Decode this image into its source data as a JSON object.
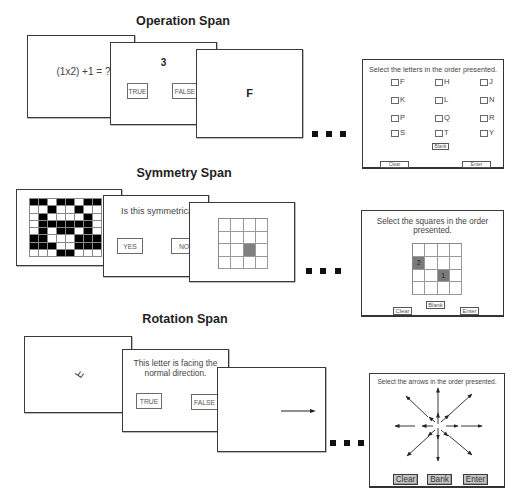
{
  "sections": {
    "operation": {
      "title": "Operation Span",
      "frame1": {
        "equation": "(1x2) +1 = ?"
      },
      "frame2": {
        "answer": "3",
        "true_label": "TRUE",
        "false_label": "FALSE"
      },
      "frame3": {
        "letter": "F"
      },
      "recall": {
        "instruction": "Select the letters in the order presented.",
        "letters": [
          "F",
          "H",
          "J",
          "K",
          "L",
          "N",
          "P",
          "Q",
          "R",
          "S",
          "T",
          "Y"
        ],
        "blank_label": "Blank",
        "clear_label": "Clear",
        "enter_label": "Enter"
      }
    },
    "symmetry": {
      "title": "Symmetry Span",
      "frame1": {
        "rows": 8,
        "cols": 8,
        "pattern": [
          "11011011",
          "00100100",
          "01000010",
          "01111110",
          "01011010",
          "11000111",
          "11100111",
          "00011000"
        ]
      },
      "frame2": {
        "question": "Is this symmetrical",
        "yes_label": "YES",
        "no_label": "NO"
      },
      "frame3": {
        "rows": 4,
        "cols": 4,
        "highlighted_cells": [
          {
            "row": 2,
            "col": 2,
            "label": ""
          }
        ]
      },
      "recall": {
        "instruction_line1": "Select the squares in the order",
        "instruction_line2": "presented.",
        "rows": 4,
        "cols": 4,
        "selected_cells": [
          {
            "row": 2,
            "col": 2,
            "label": "1"
          },
          {
            "row": 1,
            "col": 0,
            "label": "2"
          }
        ],
        "blank_label": "Blank",
        "clear_label": "Clear",
        "enter_label": "Enter"
      }
    },
    "rotation": {
      "title": "Rotation Span",
      "frame1": {
        "rotated_letter": "F"
      },
      "frame2": {
        "statement_line1": "This letter is facing the",
        "statement_line2": "normal direction.",
        "true_label": "TRUE",
        "false_label": "FALSE"
      },
      "frame3": {
        "arrow_direction": "right"
      },
      "recall": {
        "instruction": "Select the arrows in the order presented.",
        "arrow_directions": [
          "up",
          "down",
          "left",
          "right",
          "up-left",
          "up-right",
          "down-left",
          "down-right"
        ],
        "arrow_lengths": [
          "short",
          "long"
        ],
        "clear_label": "Clear",
        "blank_label": "Bank",
        "enter_label": "Enter"
      }
    }
  },
  "ellipsis": "...",
  "colors": {
    "frame_border": "#3a3a3a",
    "black_cell": "#000000",
    "highlight_cell": "#808080",
    "selected_cell": "#7a7a7a",
    "gray_button": "#c6c6c6"
  }
}
